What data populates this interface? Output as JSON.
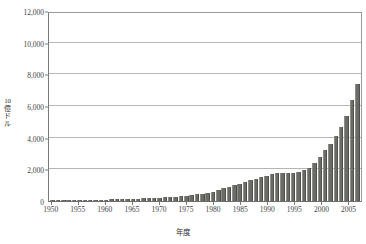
{
  "chart_data": {
    "type": "bar",
    "title": "",
    "xlabel": "年度",
    "ylabel": "10億ドル",
    "ylim": [
      0,
      12000
    ],
    "ytick_values": [
      0,
      2000,
      4000,
      6000,
      8000,
      10000,
      12000
    ],
    "ytick_labels": [
      "0",
      "2,000",
      "4,000",
      "6,000",
      "8,000",
      "10,000",
      "12,000"
    ],
    "xtick_labels": [
      "1950",
      "1955",
      "1960",
      "1965",
      "1970",
      "1975",
      "1980",
      "1985",
      "1990",
      "1995",
      "2000",
      "2005"
    ],
    "xtick_years": [
      1950,
      1955,
      1960,
      1965,
      1970,
      1975,
      1980,
      1985,
      1990,
      1995,
      2000,
      2005
    ],
    "grid": true,
    "legend": false,
    "bar_color": "#6c6c67",
    "categories": [
      1950,
      1951,
      1952,
      1953,
      1954,
      1955,
      1956,
      1957,
      1958,
      1959,
      1960,
      1961,
      1962,
      1963,
      1964,
      1965,
      1966,
      1967,
      1968,
      1969,
      1970,
      1971,
      1972,
      1973,
      1974,
      1975,
      1976,
      1977,
      1978,
      1979,
      1980,
      1981,
      1982,
      1983,
      1984,
      1985,
      1986,
      1987,
      1988,
      1989,
      1990,
      1991,
      1992,
      1993,
      1994,
      1995,
      1996,
      1997,
      1998,
      1999,
      2000,
      2001,
      2002,
      2003,
      2004,
      2005,
      2006,
      2007
    ],
    "values": [
      40,
      50,
      60,
      65,
      70,
      75,
      80,
      85,
      90,
      95,
      95,
      100,
      110,
      115,
      120,
      130,
      145,
      160,
      180,
      195,
      210,
      230,
      255,
      280,
      300,
      340,
      380,
      420,
      470,
      520,
      600,
      700,
      800,
      900,
      1000,
      1100,
      1200,
      1300,
      1400,
      1500,
      1600,
      1700,
      1750,
      1750,
      1750,
      1800,
      1850,
      1950,
      2100,
      2400,
      2800,
      3200,
      3600,
      4100,
      4700,
      5400,
      6400,
      7400
    ],
    "values_note": "bar heights in 10億ドル units as read from the axis"
  }
}
